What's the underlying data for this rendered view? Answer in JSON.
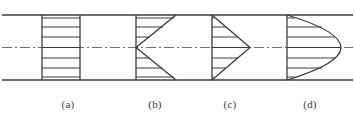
{
  "figure": {
    "kind": "technical-line-diagram",
    "background_color": "#ffffff",
    "line_color": "#3c3c3c",
    "centerline_color": "#6f6f6f",
    "width": 355,
    "height": 125
  },
  "pipe": {
    "top_wall_y": 15,
    "bottom_wall_y": 80,
    "left_x": 2,
    "right_x": 353,
    "centerline_y": 47.5,
    "wall_stroke_width": 1.3,
    "centerline_dash_pattern": "10 3 2 3"
  },
  "profiles": [
    {
      "id": "a",
      "label": "(a)",
      "shape": "uniform",
      "description": "uniform plug velocity profile, constant velocity across the section",
      "baseline_x": 42,
      "max_extent_x": 80,
      "label_x": 68,
      "arrow_count": 7,
      "arrow_lengths": [
        38,
        38,
        38,
        38,
        38,
        38,
        38
      ]
    },
    {
      "id": "b",
      "label": "(b)",
      "shape": "inverted-wedge",
      "description": "reversed wedge profile, minimum velocity at the centerline and maximum at the walls",
      "baseline_x": 136,
      "max_extent_x": 176,
      "label_x": 155,
      "arrow_count": 7,
      "arrow_lengths": [
        40,
        27,
        14,
        2,
        14,
        27,
        40
      ]
    },
    {
      "id": "c",
      "label": "(c)",
      "shape": "triangular",
      "description": "triangular wedge profile, maximum velocity at the centerline tapering linearly to zero at the walls",
      "baseline_x": 212,
      "max_extent_x": 250,
      "label_x": 230,
      "arrow_count": 7,
      "arrow_lengths": [
        2,
        14,
        26,
        38,
        26,
        14,
        2
      ]
    },
    {
      "id": "d",
      "label": "(d)",
      "shape": "parabolic",
      "description": "parabolic laminar velocity profile, maximum velocity at the centerline with rounded blunt nose",
      "baseline_x": 287,
      "max_extent_x": 341,
      "label_x": 310,
      "arrow_count": 7,
      "arrow_lengths": [
        8,
        35,
        48,
        54,
        48,
        35,
        8
      ]
    }
  ],
  "arrow_rows_y": [
    18,
    27,
    37,
    47.5,
    58,
    68,
    77
  ]
}
